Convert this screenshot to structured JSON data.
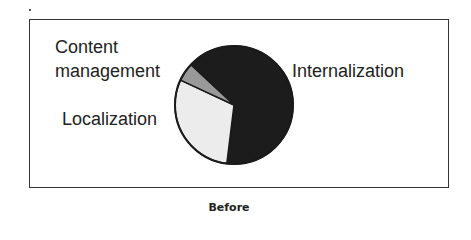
{
  "caption": "Before",
  "labels": {
    "content_line1": "Content",
    "content_line2": "management",
    "localization": "Localization",
    "internalization": "Internalization"
  },
  "colors": {
    "internalization": "#1c1c1c",
    "localization": "#ececec",
    "content_management": "#999999",
    "outline": "#1a1a1a"
  },
  "chart_data": {
    "type": "pie",
    "title": "",
    "caption": "Before",
    "categories": [
      "Internalization",
      "Localization",
      "Content management"
    ],
    "values": [
      65,
      30,
      5
    ],
    "unit": "percent (estimated from slice angles)",
    "start_angle_deg_clockwise_from_top": 313,
    "legend": "none (direct labels)",
    "colors": [
      "#1c1c1c",
      "#ececec",
      "#999999"
    ]
  }
}
